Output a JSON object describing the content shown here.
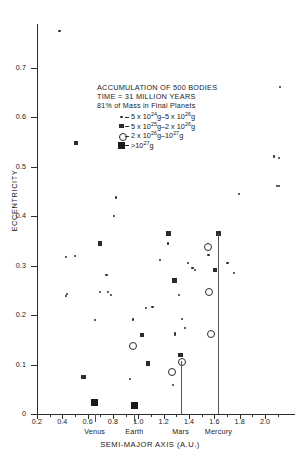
{
  "chart_data": {
    "type": "scatter",
    "title": "ACCUMULATION OF 500 BODIES",
    "subtitle": "TIME = 31 MILLION YEARS",
    "subtitle2": "81% of Mass in Final Planets",
    "xlabel": "SEMI-MAJOR AXIS (A.U.)",
    "ylabel": "ECCENTRICITY",
    "xlim": [
      0.2,
      2.15
    ],
    "ylim": [
      0.0,
      0.79
    ],
    "xticks": [
      0.2,
      0.4,
      0.6,
      0.8,
      1.0,
      1.2,
      1.4,
      1.6,
      1.8,
      2.0
    ],
    "xticklabels": [
      "0.2",
      "0.4",
      "0.6",
      "0.8",
      "1.0",
      "1.2",
      "1.4",
      "1.6",
      "1.8",
      "2.0"
    ],
    "yticks": [
      0,
      0.1,
      0.2,
      0.3,
      0.4,
      0.5,
      0.6,
      0.7
    ],
    "yticklabels": [
      "0",
      "0.1",
      "0.2",
      "0.3",
      "0.4",
      "0.5",
      "0.6",
      "0.7"
    ],
    "grid": false,
    "legend_position": "upper-center",
    "legend": [
      {
        "marker": "small-dot",
        "label_html": "5 x 10<sup>24</sup>g–5 x 10<sup>26</sup>g"
      },
      {
        "marker": "medium-dot",
        "label_html": "5 x 10<sup>25</sup>g–2 x 10<sup>26</sup>g"
      },
      {
        "marker": "open-circle",
        "label_html": "2 x 10<sup>26</sup>g–10<sup>27</sup>g"
      },
      {
        "marker": "large-square",
        "label_html": ">10<sup>27</sup>g"
      }
    ],
    "planets": [
      {
        "name": "Venus",
        "a": 0.655,
        "e": 0.023,
        "marker": "large-square"
      },
      {
        "name": "Earth",
        "a": 0.968,
        "e": 0.018,
        "marker": "large-square"
      },
      {
        "name": "Mars",
        "a": 1.333,
        "e": 0.107,
        "marker": "open-circle"
      },
      {
        "name": "Mercury",
        "a": 1.632,
        "e": 0.365,
        "marker": "medium-dot"
      }
    ],
    "series": [
      {
        "name": "5 x 10^24 g - 5 x 10^26 g",
        "marker": "small-dot",
        "points": [
          [
            0.378,
            0.775
          ],
          [
            2.118,
            0.662
          ],
          [
            2.072,
            0.521
          ],
          [
            2.108,
            0.518
          ],
          [
            2.095,
            0.462
          ],
          [
            2.112,
            0.462
          ],
          [
            1.793,
            0.445
          ],
          [
            0.822,
            0.438
          ],
          [
            0.81,
            0.401
          ],
          [
            1.235,
            0.345
          ],
          [
            1.553,
            0.321
          ],
          [
            0.43,
            0.318
          ],
          [
            0.5,
            0.32
          ],
          [
            1.17,
            0.312
          ],
          [
            1.703,
            0.305
          ],
          [
            1.392,
            0.306
          ],
          [
            1.447,
            0.292
          ],
          [
            1.598,
            0.293
          ],
          [
            1.757,
            0.285
          ],
          [
            1.428,
            0.296
          ],
          [
            0.748,
            0.282
          ],
          [
            1.608,
            0.289
          ],
          [
            0.7,
            0.246
          ],
          [
            0.762,
            0.246
          ],
          [
            0.782,
            0.241
          ],
          [
            0.432,
            0.239
          ],
          [
            0.44,
            0.243
          ],
          [
            1.323,
            0.24
          ],
          [
            1.112,
            0.217
          ],
          [
            1.058,
            0.215
          ],
          [
            0.655,
            0.19
          ],
          [
            1.342,
            0.193
          ],
          [
            0.958,
            0.191
          ],
          [
            1.367,
            0.174
          ],
          [
            1.29,
            0.161
          ],
          [
            1.273,
            0.059
          ],
          [
            0.935,
            0.071
          ],
          [
            1.29,
            0.164
          ]
        ]
      },
      {
        "name": "5 x 10^25 g - 2 x 10^26 g",
        "marker": "medium-dot",
        "points": [
          [
            0.51,
            0.548
          ],
          [
            1.632,
            0.365
          ],
          [
            1.238,
            0.365
          ],
          [
            0.7,
            0.345
          ],
          [
            1.285,
            0.27
          ],
          [
            1.608,
            0.292
          ],
          [
            0.567,
            0.075
          ],
          [
            1.03,
            0.16
          ],
          [
            1.073,
            0.102
          ],
          [
            1.332,
            0.12
          ]
        ]
      },
      {
        "name": "2 x 10^26 g - 10^27 g",
        "marker": "open-circle",
        "points": [
          [
            1.545,
            0.339
          ],
          [
            1.55,
            0.248
          ],
          [
            1.562,
            0.163
          ],
          [
            0.95,
            0.14
          ],
          [
            1.333,
            0.107
          ],
          [
            1.258,
            0.088
          ]
        ]
      },
      {
        "name": "> 10^27 g",
        "marker": "large-square",
        "points": [
          [
            0.655,
            0.023
          ],
          [
            0.968,
            0.018
          ]
        ]
      }
    ]
  }
}
